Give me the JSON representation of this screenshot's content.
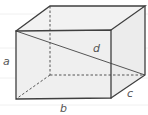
{
  "figure": {
    "type": "rectangular-box-diagram",
    "labels": {
      "height": "a",
      "width": "b",
      "depth": "c",
      "diagonal": "d"
    },
    "colors": {
      "background": "#ffffff",
      "face": "#efefef",
      "edge": "#3f3f3f",
      "hidden_edge": "#555555",
      "label": "#555555"
    }
  }
}
